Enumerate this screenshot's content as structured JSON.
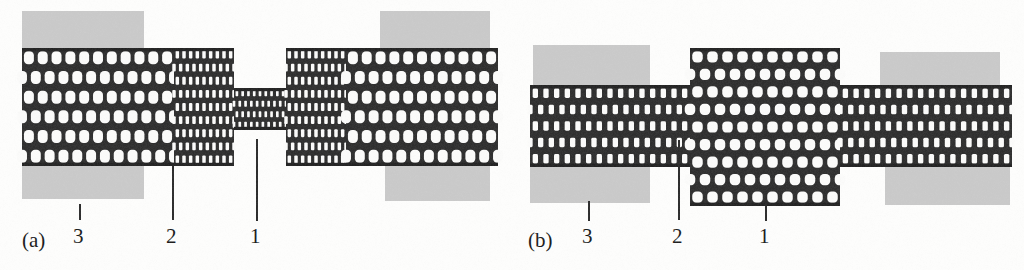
{
  "figure": {
    "type": "scientific-schematic",
    "background_color": "#fdfdfc",
    "ink_color": "#1a1a1a",
    "electrode_color": "#c9c9c9"
  },
  "panels": [
    {
      "tag": "(a)",
      "tag_x": 22,
      "tag_y": 228,
      "structure": "wide-narrow-wide",
      "tube": {
        "left_segment": {
          "x": 22,
          "y": 48,
          "w": 152,
          "h": 118,
          "kind": "wide",
          "cols": 11,
          "rows": 6
        },
        "mid_segment": {
          "x": 174,
          "y": 48,
          "w": 60,
          "h": 118,
          "kind": "medium",
          "cols": 9,
          "rows": 9
        },
        "neck_segment": {
          "x": 234,
          "y": 88,
          "w": 52,
          "h": 42,
          "kind": "narrow",
          "cols": 9,
          "rows": 4
        },
        "right_mid": {
          "x": 286,
          "y": 48,
          "w": 60,
          "h": 118,
          "kind": "medium",
          "cols": 9,
          "rows": 9
        },
        "right_segment": {
          "x": 346,
          "y": 48,
          "w": 152,
          "h": 118,
          "kind": "wide",
          "cols": 11,
          "rows": 6
        }
      },
      "electrodes": [
        {
          "name": "electrode-top-left",
          "x": 22,
          "y": 11,
          "w": 122,
          "h": 41
        },
        {
          "name": "electrode-top-right",
          "x": 380,
          "y": 11,
          "w": 110,
          "h": 41
        },
        {
          "name": "electrode-bottom-left",
          "x": 22,
          "y": 163,
          "w": 122,
          "h": 36
        },
        {
          "name": "electrode-bottom-right",
          "x": 385,
          "y": 163,
          "w": 105,
          "h": 38
        }
      ],
      "annotations": [
        {
          "label": "3",
          "label_x": 73,
          "label_y": 226,
          "leader_x": 79,
          "leader_y": 204,
          "leader_h": 16
        },
        {
          "label": "2",
          "label_x": 166,
          "label_y": 226,
          "leader_x": 172,
          "leader_y": 166,
          "leader_h": 54
        },
        {
          "label": "1",
          "label_x": 250,
          "label_y": 226,
          "leader_x": 256,
          "leader_y": 139,
          "leader_h": 82
        }
      ]
    },
    {
      "tag": "(b)",
      "tag_x": 528,
      "tag_y": 228,
      "structure": "narrow-wide-narrow",
      "tube": {
        "left_segment": {
          "x": 530,
          "y": 85,
          "w": 160,
          "h": 82,
          "kind": "narrow-long",
          "cols": 15,
          "rows": 5
        },
        "bulge_segment": {
          "x": 690,
          "y": 48,
          "w": 150,
          "h": 158,
          "kind": "wide-bulge",
          "cols": 10,
          "rows": 9
        },
        "right_segment": {
          "x": 840,
          "y": 85,
          "w": 172,
          "h": 82,
          "kind": "narrow-long",
          "cols": 16,
          "rows": 5
        }
      },
      "electrodes": [
        {
          "name": "electrode-top-left",
          "x": 533,
          "y": 45,
          "w": 117,
          "h": 41
        },
        {
          "name": "electrode-top-right",
          "x": 880,
          "y": 52,
          "w": 120,
          "h": 35
        },
        {
          "name": "electrode-bottom-left",
          "x": 530,
          "y": 165,
          "w": 120,
          "h": 38
        },
        {
          "name": "electrode-bottom-right",
          "x": 885,
          "y": 165,
          "w": 125,
          "h": 40
        }
      ],
      "annotations": [
        {
          "label": "3",
          "label_x": 582,
          "label_y": 226,
          "leader_x": 588,
          "leader_y": 201,
          "leader_h": 20
        },
        {
          "label": "2",
          "label_x": 672,
          "label_y": 226,
          "leader_x": 678,
          "leader_y": 140,
          "leader_h": 80
        },
        {
          "label": "1",
          "label_x": 759,
          "label_y": 226,
          "leader_x": 765,
          "leader_y": 191,
          "leader_h": 30
        }
      ]
    }
  ]
}
